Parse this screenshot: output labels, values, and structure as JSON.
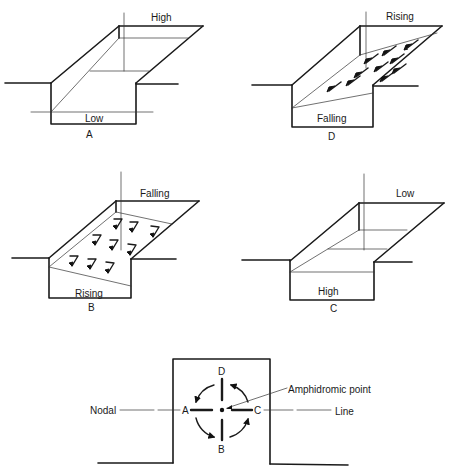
{
  "panels": {
    "A": {
      "caption": "A",
      "top_label": "High",
      "bottom_label": "Low"
    },
    "D": {
      "caption": "D",
      "top_label": "Rising",
      "bottom_label": "Falling"
    },
    "B": {
      "caption": "B",
      "top_label": "Falling",
      "bottom_label": "Rising"
    },
    "C": {
      "caption": "C",
      "top_label": "Low",
      "bottom_label": "High"
    }
  },
  "amphidrome": {
    "point_labels": [
      "A",
      "B",
      "C",
      "D"
    ],
    "callout": "Amphidromic point",
    "nodal_left": "Nodal",
    "nodal_right": "Line",
    "rotation": "counterclockwise"
  }
}
